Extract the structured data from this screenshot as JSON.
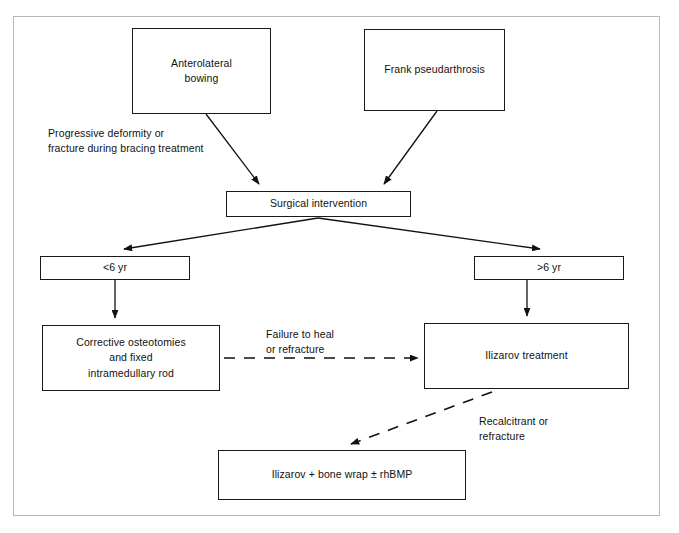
{
  "figure": {
    "type": "clinical-treatment-flowchart",
    "frame_color": "#b9b9b9",
    "line_color": "#1a1a1a",
    "text_color": "#111111",
    "background": "#ffffff"
  },
  "nodes": {
    "anterolateral_bowing": "Anterolateral\nbowing",
    "frank_pseudarthrosis": "Frank pseudarthrosis",
    "surgical_intervention": "Surgical intervention",
    "under_6yr": "<6 yr",
    "over_6yr": ">6 yr",
    "corrective_osteotomies": "Corrective osteotomies\nand fixed\nintramedullary rod",
    "ilizarov_treatment": "Ilizarov treatment",
    "ilizarov_bone_wrap": "Ilizarov + bone wrap ± rhBMP"
  },
  "edge_labels": {
    "progressive_deformity": "Progressive deformity or\nfracture during bracing treatment",
    "failure_to_heal": "Failure to heal\nor refracture",
    "recalcitrant": "Recalcitrant or\nrefracture"
  },
  "edges": [
    {
      "from": "anterolateral_bowing",
      "to": "surgical_intervention",
      "style": "solid",
      "arrow": true,
      "label": "progressive_deformity"
    },
    {
      "from": "frank_pseudarthrosis",
      "to": "surgical_intervention",
      "style": "solid",
      "arrow": true,
      "label": null
    },
    {
      "from": "surgical_intervention",
      "to": "under_6yr",
      "style": "solid",
      "arrow": true,
      "label": null
    },
    {
      "from": "surgical_intervention",
      "to": "over_6yr",
      "style": "solid",
      "arrow": true,
      "label": null
    },
    {
      "from": "under_6yr",
      "to": "corrective_osteotomies",
      "style": "solid",
      "arrow": true,
      "label": null
    },
    {
      "from": "over_6yr",
      "to": "ilizarov_treatment",
      "style": "solid",
      "arrow": true,
      "label": null
    },
    {
      "from": "corrective_osteotomies",
      "to": "ilizarov_treatment",
      "style": "dashed",
      "arrow": true,
      "label": "failure_to_heal"
    },
    {
      "from": "ilizarov_treatment",
      "to": "ilizarov_bone_wrap",
      "style": "dashed",
      "arrow": true,
      "label": "recalcitrant"
    }
  ]
}
